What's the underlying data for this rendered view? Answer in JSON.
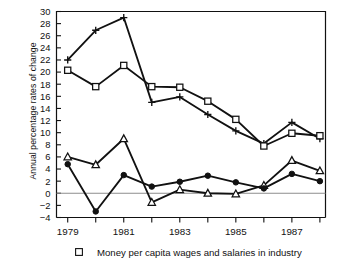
{
  "chart_data": {
    "type": "line",
    "title": "",
    "xlabel": "",
    "ylabel": "Annual percentage rates of change",
    "xlim": [
      1978.6,
      1988.2
    ],
    "ylim": [
      -4,
      30
    ],
    "ytick_step": 2,
    "yticks": [
      -4,
      -2,
      0,
      2,
      4,
      6,
      8,
      10,
      12,
      14,
      16,
      18,
      20,
      22,
      24,
      26,
      28,
      30
    ],
    "ytick_labels": [
      "−4",
      "−2",
      "0",
      "2",
      "4",
      "6",
      "8",
      "10",
      "12",
      "14",
      "16",
      "18",
      "20",
      "22",
      "24",
      "26",
      "28",
      "30"
    ],
    "x": [
      1979,
      1980,
      1981,
      1982,
      1983,
      1984,
      1985,
      1986,
      1987,
      1988
    ],
    "xticks": [
      1979,
      1980,
      1981,
      1982,
      1983,
      1984,
      1985,
      1986,
      1987,
      1988
    ],
    "xtick_labels": [
      "1979",
      "",
      "1981",
      "",
      "1983",
      "",
      "1985",
      "",
      "1987",
      ""
    ],
    "xtick_labels_shown": [
      "1979",
      "1981",
      "1983",
      "1985",
      "1987"
    ],
    "grid": false,
    "zero_line": true,
    "legend_position": "bottom",
    "series": [
      {
        "name": "series-plus",
        "marker": "plus",
        "values": [
          22.0,
          26.9,
          29.0,
          15.0,
          15.9,
          13.0,
          10.3,
          8.2,
          11.7,
          9.0
        ]
      },
      {
        "name": "money-per-capita-wages-and-salaries-in-industry",
        "marker": "square",
        "values": [
          20.3,
          17.6,
          21.1,
          17.6,
          17.5,
          15.2,
          12.2,
          7.8,
          9.9,
          9.5
        ]
      },
      {
        "name": "series-triangle",
        "marker": "triangle",
        "values": [
          6.0,
          4.7,
          9.0,
          -1.5,
          0.6,
          0.0,
          -0.1,
          1.3,
          5.4,
          3.7
        ]
      },
      {
        "name": "series-circle",
        "marker": "circle-filled",
        "values": [
          4.8,
          -3.0,
          3.0,
          1.1,
          1.9,
          2.9,
          1.8,
          0.8,
          3.2,
          2.0
        ]
      }
    ],
    "legend": [
      {
        "marker": "square",
        "label": "Money per capita wages and salaries in industry"
      }
    ]
  },
  "axis": {
    "ylabel": "Annual percentage rates of change"
  }
}
